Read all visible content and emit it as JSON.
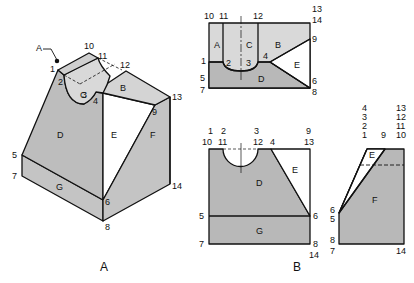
{
  "colors": {
    "face_light": "#d9d9d9",
    "face_mid": "#c4c4c4",
    "face_dark": "#b5b5b5",
    "line": "#111111",
    "bg": "#ffffff"
  },
  "captions": {
    "a": "A",
    "b": "B"
  },
  "pictorial": {
    "face_labels": {
      "A": "A",
      "B": "B",
      "C": "C",
      "D": "D",
      "E": "E",
      "F": "F",
      "G": "G"
    },
    "points": {
      "p1": "1",
      "p2": "2",
      "p3": "3",
      "p4": "4",
      "p5": "5",
      "p6": "6",
      "p7": "7",
      "p8": "8",
      "p9": "9",
      "p10": "10",
      "p11": "11",
      "p12": "12",
      "p13": "13",
      "p14": "14"
    }
  },
  "top_view": {
    "face_labels": {
      "A": "A",
      "B": "B",
      "C": "C",
      "D": "D",
      "E": "E"
    },
    "points": {
      "p10": "10",
      "p11": "11",
      "p12": "12",
      "p13": "13",
      "p14": "14",
      "p1": "1",
      "p2": "2",
      "p3": "3",
      "p4": "4",
      "p9": "9",
      "p5": "5",
      "p7": "7",
      "p6": "6",
      "p8": "8"
    }
  },
  "front_view": {
    "face_labels": {
      "D": "D",
      "E": "E",
      "G": "G"
    },
    "top_row": {
      "p1": "1",
      "p2": "2",
      "p3": "3",
      "p9": "9"
    },
    "second_row": {
      "p10": "10",
      "p11": "11",
      "p12": "12",
      "p4": "4",
      "p13": "13"
    },
    "points": {
      "p5": "5",
      "p7": "7",
      "p6": "6",
      "p8": "8",
      "p14": "14"
    }
  },
  "side_view": {
    "face_labels": {
      "E": "E",
      "F": "F"
    },
    "stack_left": [
      "4",
      "3",
      "2",
      "1"
    ],
    "stack_right": [
      "13",
      "12",
      "11",
      "10"
    ],
    "points": {
      "p9": "9",
      "p6": "6",
      "p5": "5",
      "p8": "8",
      "p7": "7",
      "p14": "14"
    }
  }
}
